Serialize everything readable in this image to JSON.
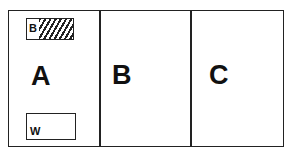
{
  "diagram": {
    "panels": [
      {
        "id": "A",
        "label": "A"
      },
      {
        "id": "B",
        "label": "B"
      },
      {
        "id": "C",
        "label": "C"
      }
    ],
    "panel_a_insets": {
      "top_box": {
        "label": "B",
        "fill": "hatched"
      },
      "bottom_box": {
        "label": "W",
        "fill": "white"
      }
    }
  }
}
